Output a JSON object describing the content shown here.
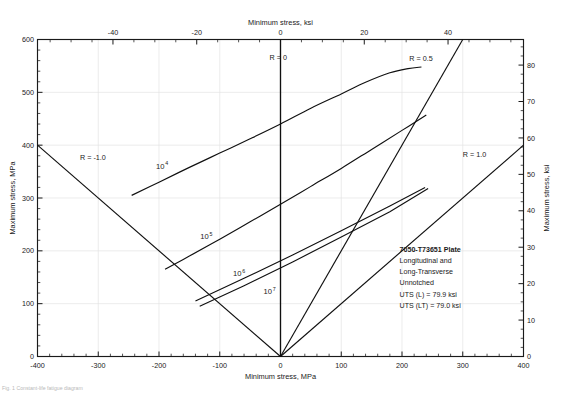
{
  "figure": {
    "name": "constant-life-fatigue-diagram",
    "caption_bottom": "Fig. 1 Constant-life fatigue diagram"
  },
  "chart_data": {
    "type": "line",
    "title": "",
    "subtitle": "",
    "xlabel": "Minimum stress, MPa",
    "xlabel_top": "Minimum stress, ksi",
    "ylabel": "Maximum stress, MPa",
    "ylabel_right": "Maximum stress, ksi",
    "xlim": [
      -400,
      400
    ],
    "ylim": [
      0,
      600
    ],
    "xlim_top_ksi": [
      -58,
      58
    ],
    "ylim_right_ksi": [
      0,
      87
    ],
    "grid": true,
    "legend": "none",
    "x_ticks": [
      -400,
      -300,
      -200,
      -100,
      0,
      100,
      200,
      300,
      400
    ],
    "x_tick_labels": [
      "-400",
      "-300",
      "-200",
      "-100",
      "0",
      "100",
      "200",
      "300",
      "400"
    ],
    "x_minor_step": 20,
    "y_ticks": [
      0,
      100,
      200,
      300,
      400,
      500,
      600
    ],
    "y_tick_labels": [
      "0",
      "100",
      "200",
      "300",
      "400",
      "500",
      "600"
    ],
    "y_minor_step": 20,
    "x_top_ticks_ksi": [
      -40,
      -20,
      0,
      20,
      40
    ],
    "x_top_tick_labels": [
      "-40",
      "-20",
      "0",
      "20",
      "40"
    ],
    "x_top_minor_step_ksi": 5,
    "y_right_ticks_ksi": [
      0,
      10,
      20,
      30,
      40,
      50,
      60,
      70,
      80
    ],
    "y_right_tick_labels": [
      "0",
      "10",
      "20",
      "30",
      "40",
      "50",
      "60",
      "70",
      "80"
    ],
    "y_right_minor_step_ksi": 2.5,
    "series": [
      {
        "name": "10^4 cycles",
        "label": "10",
        "exponent": "4",
        "label_at": [
          -205,
          355
        ],
        "points": [
          [
            -245,
            305
          ],
          [
            -200,
            330
          ],
          [
            -150,
            358
          ],
          [
            -100,
            385
          ],
          [
            -50,
            412
          ],
          [
            0,
            440
          ],
          [
            50,
            470
          ],
          [
            100,
            497
          ],
          [
            140,
            519
          ],
          [
            180,
            537
          ],
          [
            210,
            545
          ],
          [
            232,
            548
          ]
        ]
      },
      {
        "name": "10^5 cycles",
        "label": "10",
        "exponent": "5",
        "label_at": [
          -132,
          222
        ],
        "points": [
          [
            -190,
            165
          ],
          [
            -150,
            190
          ],
          [
            -100,
            222
          ],
          [
            -50,
            255
          ],
          [
            0,
            288
          ],
          [
            50,
            322
          ],
          [
            100,
            356
          ],
          [
            150,
            392
          ],
          [
            200,
            428
          ],
          [
            240,
            457
          ]
        ]
      },
      {
        "name": "10^6 cycles",
        "label": "10",
        "exponent": "6",
        "label_at": [
          -78,
          152
        ]
      },
      {
        "name": "10^7 cycles",
        "label": "10",
        "exponent": "7",
        "label_at": [
          -28,
          118
        ]
      }
    ],
    "r_lines": [
      {
        "name": "R = -1.0",
        "label": "R = -1.0",
        "label_at": [
          -330,
          372
        ],
        "from": [
          -400,
          400
        ],
        "to": [
          0,
          0
        ]
      },
      {
        "name": "R = 0",
        "label": "R = 0",
        "label_at": [
          -18,
          562
        ],
        "from": [
          0,
          0
        ],
        "to": [
          0,
          600
        ]
      },
      {
        "name": "R = 0.5",
        "label": "R = 0.5",
        "label_at": [
          212,
          560
        ],
        "from": [
          0,
          0
        ],
        "to": [
          300,
          600
        ]
      },
      {
        "name": "R = 1.0",
        "label": "R = 1.0",
        "label_at": [
          300,
          378
        ],
        "from": [
          0,
          0
        ],
        "to": [
          400,
          400
        ]
      }
    ],
    "annotation_box": {
      "name": "material-note",
      "lines": [
        "7050-T73651 Plate",
        "Longitudinal and",
        "Long-Transverse",
        "Unnotched",
        "UTS (L) = 79.9 ksi",
        "UTS (LT) = 79.0 ksi"
      ],
      "bold_first_line": true,
      "at": [
        196,
        198
      ]
    },
    "colors": {
      "curve": "#101010",
      "frame": "#1a1a1a",
      "grid": "#e4e4e4",
      "text": "#1a1a1a"
    }
  }
}
